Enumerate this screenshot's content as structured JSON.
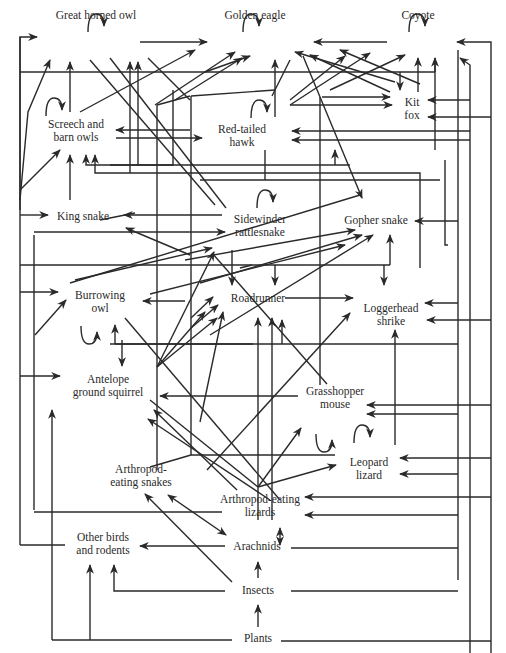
{
  "nodes": [
    {
      "id": "great_horned_owl",
      "label": "Great horned owl",
      "x": 96,
      "y": 9
    },
    {
      "id": "golden_eagle",
      "label": "Golden eagle",
      "x": 255,
      "y": 9
    },
    {
      "id": "coyote",
      "label": "Coyote",
      "x": 418,
      "y": 9
    },
    {
      "id": "kit_fox",
      "label": "Kit\nfox",
      "x": 410,
      "y": 98
    },
    {
      "id": "screech_barn_owls",
      "label": "Screech and\nbarn owls",
      "x": 76,
      "y": 120
    },
    {
      "id": "red_tailed_hawk",
      "label": "Red-tailed\nhawk",
      "x": 242,
      "y": 125
    },
    {
      "id": "king_snake",
      "label": "King snake",
      "x": 83,
      "y": 212
    },
    {
      "id": "sidewinder",
      "label": "Sidewinder\nrattlesnake",
      "x": 258,
      "y": 215
    },
    {
      "id": "gopher_snake",
      "label": "Gopher snake",
      "x": 376,
      "y": 219
    },
    {
      "id": "burrowing_owl",
      "label": "Burrowing\nowl",
      "x": 100,
      "y": 290
    },
    {
      "id": "roadrunner",
      "label": "Roadrunner",
      "x": 258,
      "y": 296
    },
    {
      "id": "loggerhead_shrike",
      "label": "Loggerhead\nshrike",
      "x": 392,
      "y": 305
    },
    {
      "id": "antelope_squirrel",
      "label": "Antelope\nground squirrel",
      "x": 108,
      "y": 376
    },
    {
      "id": "grasshopper_mouse",
      "label": "Grasshopper\nmouse",
      "x": 336,
      "y": 386
    },
    {
      "id": "leopard_lizard",
      "label": "Leopard\nlizard",
      "x": 368,
      "y": 458
    },
    {
      "id": "arthropod_snakes",
      "label": "Arthropod-\neating snakes",
      "x": 140,
      "y": 465
    },
    {
      "id": "arthropod_lizards",
      "label": "Arthropod-eating\nlizards",
      "x": 270,
      "y": 495
    },
    {
      "id": "other_birds_rodents",
      "label": "Other birds\nand rodents",
      "x": 103,
      "y": 533
    },
    {
      "id": "arachnids",
      "label": "Arachnids",
      "x": 258,
      "y": 541
    },
    {
      "id": "insects",
      "label": "Insects",
      "x": 262,
      "y": 583
    },
    {
      "id": "plants",
      "label": "Plants",
      "x": 262,
      "y": 631
    }
  ]
}
